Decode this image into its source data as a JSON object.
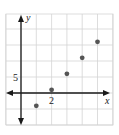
{
  "chart_data": {
    "type": "scatter",
    "title": "",
    "xlabel": "x",
    "ylabel": "y",
    "x_tick_label": {
      "value": 2,
      "text": "2"
    },
    "y_tick_label": {
      "value": 5,
      "text": "5"
    },
    "x_grid_step": 1,
    "y_grid_step": 5,
    "xlim": [
      -1,
      6
    ],
    "ylim": [
      -10,
      25
    ],
    "grid": true,
    "points": [
      {
        "x": 1,
        "y": -4
      },
      {
        "x": 2,
        "y": 1
      },
      {
        "x": 3,
        "y": 6
      },
      {
        "x": 4,
        "y": 11
      },
      {
        "x": 5,
        "y": 16
      }
    ],
    "colors": {
      "grid": "#d4d4d4",
      "axis": "#1a1a1a",
      "point": "#555555"
    }
  }
}
